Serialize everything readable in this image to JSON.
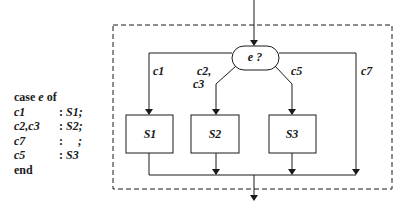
{
  "code": {
    "header": {
      "kw1": "case",
      "expr": "e",
      "kw2": "of"
    },
    "rows": [
      {
        "label": "c1",
        "sep": ":",
        "stmt": "S1;"
      },
      {
        "label": "c2,c3",
        "sep": ":",
        "stmt": "S2;"
      },
      {
        "label": "c7",
        "sep": ":",
        "stmt": "    ;"
      },
      {
        "label": "c5",
        "sep": ":",
        "stmt": "S3"
      }
    ],
    "footer": "end"
  },
  "diagram": {
    "decision": {
      "label": "e ?"
    },
    "branches": [
      {
        "label": "c1"
      },
      {
        "label_line1": "c2,",
        "label_line2": "c3"
      },
      {
        "label": "c5"
      },
      {
        "label": "c7"
      }
    ],
    "boxes": [
      {
        "label": "S1"
      },
      {
        "label": "S2"
      },
      {
        "label": "S3"
      }
    ],
    "colors": {
      "stroke": "#1a1a1a",
      "background": "#ffffff"
    }
  }
}
